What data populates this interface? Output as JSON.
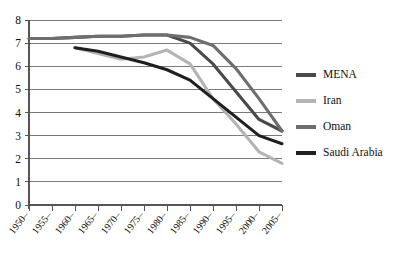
{
  "chart_data": {
    "type": "line",
    "title": "",
    "xlabel": "",
    "ylabel": "",
    "ylim": [
      0,
      8
    ],
    "ytick_step": 1,
    "grid": true,
    "legend_position": "right",
    "categories": [
      "1950–",
      "1955–",
      "1960–",
      "1965–",
      "1970–",
      "1975–",
      "1980–",
      "1985–",
      "1990–",
      "1995–",
      "2000–",
      "2005–"
    ],
    "yticks": [
      "0",
      "1",
      "2",
      "3",
      "4",
      "5",
      "6",
      "7",
      "8"
    ],
    "series": [
      {
        "name": "MENA",
        "color": "#4a4a4a",
        "values": [
          7.2,
          7.2,
          7.25,
          7.3,
          7.3,
          7.35,
          7.35,
          7.0,
          6.1,
          4.9,
          3.7,
          3.2
        ]
      },
      {
        "name": "Iran",
        "color": "#b4b4b4",
        "values": [
          null,
          null,
          6.8,
          6.55,
          6.3,
          6.4,
          6.7,
          6.1,
          4.6,
          3.5,
          2.3,
          1.8
        ]
      },
      {
        "name": "Oman",
        "color": "#6e6e6e",
        "values": [
          7.2,
          7.2,
          7.25,
          7.3,
          7.3,
          7.35,
          7.35,
          7.25,
          6.9,
          5.9,
          4.6,
          3.2
        ]
      },
      {
        "name": "Saudi Arabia",
        "color": "#1f1f1f",
        "values": [
          null,
          null,
          6.8,
          6.65,
          6.4,
          6.15,
          5.85,
          5.4,
          4.6,
          3.8,
          3.0,
          2.65
        ]
      }
    ]
  },
  "legend": {
    "items": [
      {
        "label": "MENA"
      },
      {
        "label": "Iran"
      },
      {
        "label": "Oman"
      },
      {
        "label": "Saudi Arabia"
      }
    ]
  },
  "colors": {
    "axis": "#555555",
    "grid": "#6b6b6b",
    "background": "#ffffff"
  }
}
